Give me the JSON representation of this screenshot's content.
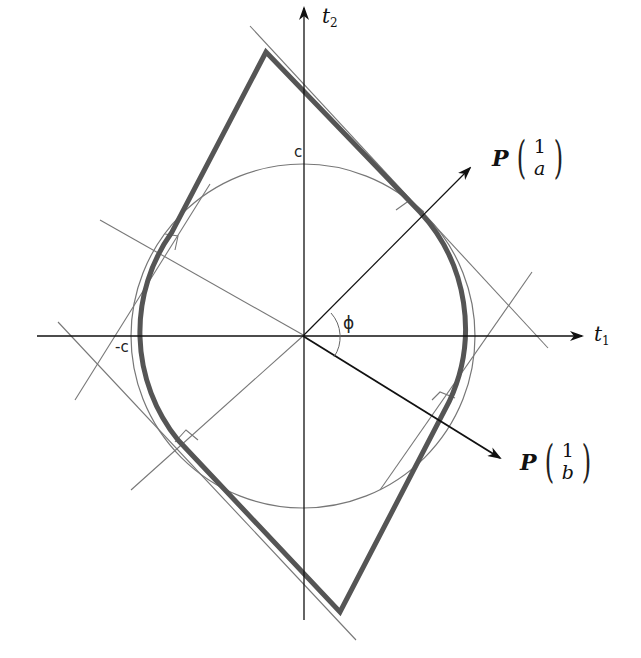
{
  "labels": {
    "t1_main": "t",
    "t1_sub": "1",
    "t2_main": "t",
    "t2_sub": "2",
    "c_pos": "c",
    "c_neg": "-c",
    "angle": "ϕ",
    "vec_a": {
      "operator": "P",
      "top": "1",
      "bottom": "a"
    },
    "vec_b": {
      "operator": "P",
      "top": "1",
      "bottom": "b"
    }
  },
  "colors": {
    "outline": "#555555",
    "axis": "#111111",
    "thin": "#777777",
    "background": "#ffffff"
  }
}
